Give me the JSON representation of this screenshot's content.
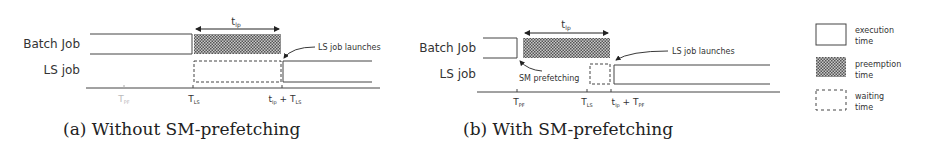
{
  "legend": {
    "execution": "execution",
    "execution_2": "time",
    "preemption": "preemption",
    "preemption_2": "time",
    "waiting": "waiting",
    "waiting_2": "time"
  },
  "panel_a": {
    "caption": "(a) Without SM-prefetching",
    "row_batch": "Batch Job",
    "row_ls": "LS job",
    "interval_label": "t",
    "interval_sub": "lp",
    "annotation_launch": "LS job launches",
    "ticks": [
      {
        "main": "T",
        "sub": "PF",
        "faded": true
      },
      {
        "main": "T",
        "sub": "LS"
      },
      {
        "main": "t",
        "sub": "lp",
        "plus": "+ T",
        "sub2": "LS"
      }
    ]
  },
  "panel_b": {
    "caption": "(b) With SM-prefetching",
    "row_batch": "Batch Job",
    "row_ls": "LS job",
    "interval_label": "t",
    "interval_sub": "lp",
    "annotation_launch": "LS job launches",
    "annotation_prefetch": "SM prefetching",
    "ticks": [
      {
        "main": "T",
        "sub": "PF"
      },
      {
        "main": "T",
        "sub": "LS"
      },
      {
        "main": "t",
        "sub": "lp",
        "plus": "+ T",
        "sub2": "PF"
      }
    ]
  },
  "colors": {
    "line": "#444444",
    "hatch": "#555555",
    "text": "#333333"
  }
}
